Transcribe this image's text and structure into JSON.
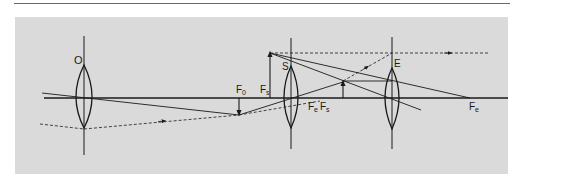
{
  "diagram": {
    "type": "optical ray diagram",
    "colors": {
      "panel_background": "#dadada",
      "page_background": "#ffffff",
      "ink": "#1a1a1a",
      "rule": "#6a6a6a"
    },
    "lenses": [
      {
        "id": "objective",
        "label": "O"
      },
      {
        "id": "field-lens",
        "label": "S"
      },
      {
        "id": "eyepiece",
        "label": "E"
      }
    ],
    "focal_points": [
      {
        "id": "F0",
        "label": "F",
        "sub": "0"
      },
      {
        "id": "Fs-upper",
        "label": "F",
        "sub": "s"
      },
      {
        "id": "Fe-mid",
        "label": "F",
        "sub": "e"
      },
      {
        "id": "Fs-mid",
        "label": "F",
        "sub": "s"
      },
      {
        "id": "Fe-right",
        "label": "F",
        "sub": "e"
      }
    ]
  }
}
